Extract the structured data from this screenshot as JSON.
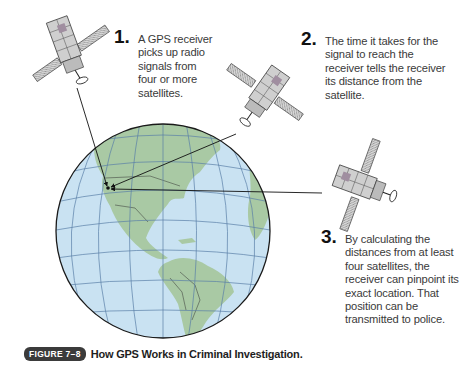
{
  "figure": {
    "label": "FIGURE 7–8",
    "title": "How GPS Works in Criminal Investigation."
  },
  "steps": [
    {
      "number": "1.",
      "text": "A GPS receiver picks up radio signals from four or more satellites."
    },
    {
      "number": "2.",
      "text": "The time it takes for the signal to reach the receiver tells the receiver its distance from the satellite."
    },
    {
      "number": "3.",
      "text": "By calculating the distances from at least four satellites, the receiver can pinpoint its exact location. That position can be transmitted to police."
    }
  ],
  "illustration": {
    "globe": {
      "ocean_color": "#c9e2f2",
      "land_color": "#a9c9a4",
      "grid_color": "#5a7fa8",
      "outline_color": "#1a1a1a"
    },
    "satellites": [
      "satellite-1",
      "satellite-2",
      "satellite-3"
    ],
    "receiver_location": "West coast of North America"
  }
}
